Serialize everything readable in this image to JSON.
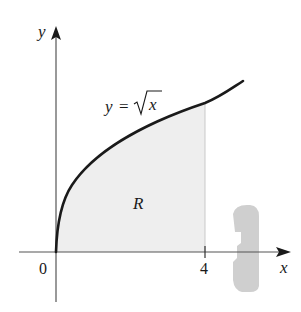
{
  "figure": {
    "type": "region-under-curve",
    "axes": {
      "x_label": "x",
      "y_label": "y",
      "origin_label": "0",
      "x_tick_label": "4"
    },
    "curve": {
      "equation_prefix": "y = ",
      "equation_radicand": "x",
      "function": "sqrt(x)",
      "domain": [
        0,
        5
      ]
    },
    "region": {
      "label": "R",
      "x_range": [
        0,
        4
      ],
      "fill_color": "#eeeeee"
    },
    "rotation_indicator": {
      "axis": "x",
      "color": "#c8c8c8"
    },
    "colors": {
      "axis": "#555555",
      "curve": "#1a1a1a"
    }
  }
}
